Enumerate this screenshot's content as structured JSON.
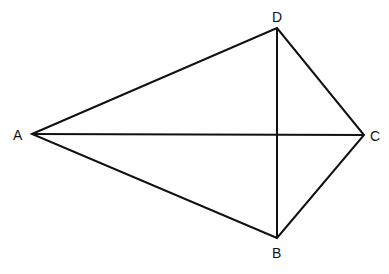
{
  "diagram": {
    "type": "kite-quadrilateral",
    "vertices": {
      "A": {
        "label": "A",
        "x": 32,
        "y": 134
      },
      "D": {
        "label": "D",
        "x": 277,
        "y": 28
      },
      "C": {
        "label": "C",
        "x": 364,
        "y": 135
      },
      "B": {
        "label": "B",
        "x": 277,
        "y": 238
      }
    },
    "edges": [
      "AD",
      "DC",
      "CB",
      "BA"
    ],
    "diagonals": [
      "AC",
      "DB"
    ],
    "stroke_color": "#111111"
  }
}
